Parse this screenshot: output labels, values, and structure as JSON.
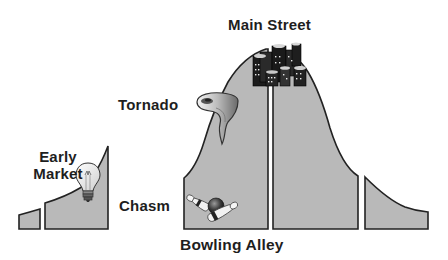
{
  "diagram": {
    "colors": {
      "fill": "#b9b9b9",
      "stroke": "#222222",
      "background": "#ffffff",
      "text": "#1e1e1e"
    },
    "labels": {
      "main_street": "Main Street",
      "tornado": "Tornado",
      "early_market_line1": "Early",
      "early_market_line2": "Market",
      "chasm": "Chasm",
      "bowling_alley": "Bowling Alley"
    },
    "icons": {
      "early_market": "lightbulb-icon",
      "tornado": "tornado-icon",
      "main_street": "city-buildings-icon",
      "bowling_alley": "bowling-ball-pins-icon"
    },
    "segments": [
      {
        "id": "innovators",
        "position": "far-left"
      },
      {
        "id": "early-adopters",
        "position": "left",
        "phase": "Early Market"
      },
      {
        "id": "early-majority",
        "position": "center-left",
        "phase": "Bowling Alley / Tornado"
      },
      {
        "id": "late-majority",
        "position": "center-right",
        "phase": "Main Street"
      },
      {
        "id": "laggards",
        "position": "far-right"
      }
    ]
  }
}
